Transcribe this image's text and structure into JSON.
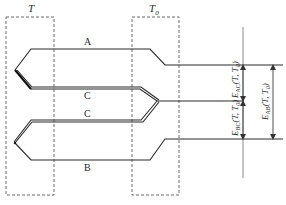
{
  "diagram": {
    "zones": [
      {
        "id": "hot",
        "label": "T"
      },
      {
        "id": "ref",
        "label": "T",
        "subscript": "0"
      }
    ],
    "wires": [
      {
        "id": "A",
        "label": "A"
      },
      {
        "id": "C1",
        "label": "C"
      },
      {
        "id": "C2",
        "label": "C"
      },
      {
        "id": "B",
        "label": "B"
      }
    ],
    "emf_labels": [
      {
        "id": "eac",
        "main": "E",
        "sub": "AC",
        "args": "(T, T",
        "argsub": "0",
        "close": ")"
      },
      {
        "id": "ebc",
        "main": "E",
        "sub": "BC",
        "args": "(T, T",
        "argsub": "0",
        "close": ")"
      },
      {
        "id": "eab",
        "main": "E",
        "sub": "AB",
        "args": "(T, T",
        "argsub": "0",
        "close": ")"
      }
    ]
  }
}
